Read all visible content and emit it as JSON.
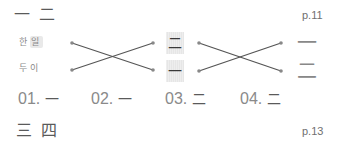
{
  "top_section": {
    "heading": "一 二",
    "page_ref": "p.11"
  },
  "matching_exercise": {
    "left_words": [
      {
        "part1": "한",
        "part2": "일"
      },
      {
        "part1": "두",
        "part2": "이"
      }
    ],
    "middle_chars": [
      "二",
      "一"
    ],
    "right_chars": [
      "一",
      "二"
    ],
    "connector_color": "#555555",
    "box_color": "#ececec"
  },
  "answers": [
    {
      "number": "01.",
      "char": "一"
    },
    {
      "number": "02.",
      "char": "一"
    },
    {
      "number": "03.",
      "char": "二"
    },
    {
      "number": "04.",
      "char": "二"
    }
  ],
  "bottom_section": {
    "heading": "三 四",
    "page_ref": "p.13"
  }
}
